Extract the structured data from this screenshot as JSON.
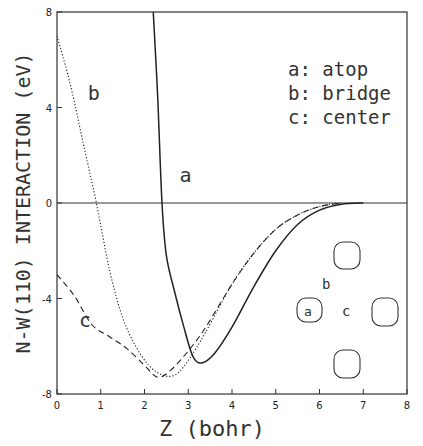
{
  "chart_data": {
    "type": "line",
    "title": "",
    "xlabel": "Z (bohr)",
    "ylabel": "N-W(110) INTERACTION (eV)",
    "xlim": [
      0,
      8
    ],
    "ylim": [
      -8,
      8
    ],
    "xticks": [
      "0",
      "1",
      "2",
      "3",
      "4",
      "5",
      "6",
      "7",
      "8"
    ],
    "yticks": [
      "-8",
      "-4",
      "0",
      "4",
      "8"
    ],
    "grid": false,
    "legend": [
      {
        "key": "a:",
        "label": "atop"
      },
      {
        "key": "b:",
        "label": "bridge"
      },
      {
        "key": "c:",
        "label": "center"
      }
    ],
    "series": [
      {
        "name": "a",
        "label": "atop",
        "style": "solid",
        "x": [
          2.2,
          2.3,
          2.4,
          2.5,
          2.7,
          2.9,
          3.1,
          3.3,
          3.6,
          4.0,
          4.5,
          5.0,
          5.5,
          6.0,
          6.5,
          7.0
        ],
        "y": [
          8.0,
          4.5,
          0.0,
          -2.2,
          -3.8,
          -5.2,
          -6.4,
          -6.7,
          -6.3,
          -5.2,
          -3.5,
          -2.0,
          -0.9,
          -0.3,
          -0.05,
          0.0
        ]
      },
      {
        "name": "b",
        "label": "bridge",
        "style": "dotted",
        "x": [
          0.0,
          0.3,
          0.6,
          0.9,
          1.2,
          1.5,
          1.8,
          2.1,
          2.4,
          2.7,
          3.0,
          3.4,
          4.0,
          4.5,
          5.0,
          5.5,
          6.0,
          6.5
        ],
        "y": [
          7.0,
          5.0,
          2.5,
          0.0,
          -2.8,
          -4.8,
          -6.0,
          -6.8,
          -7.2,
          -7.2,
          -6.6,
          -5.4,
          -3.4,
          -2.1,
          -1.1,
          -0.5,
          -0.15,
          0.0
        ]
      },
      {
        "name": "c",
        "label": "center",
        "style": "dashed",
        "x": [
          0.0,
          0.4,
          0.8,
          1.2,
          1.6,
          2.0,
          2.3,
          2.6,
          3.0,
          3.4,
          4.0,
          4.5,
          5.0,
          5.5,
          6.0,
          6.5
        ],
        "y": [
          -3.0,
          -3.9,
          -5.1,
          -5.6,
          -6.1,
          -6.8,
          -7.3,
          -7.0,
          -6.2,
          -5.2,
          -3.4,
          -2.1,
          -1.1,
          -0.5,
          -0.15,
          0.0
        ]
      }
    ],
    "annotations": [
      {
        "text": "a",
        "x": 2.8,
        "y": 0.9
      },
      {
        "text": "b",
        "x": 0.7,
        "y": 4.3
      },
      {
        "text": "c",
        "x": 0.5,
        "y": -5.2
      }
    ],
    "inset": {
      "description": "W(110) surface unit sketch with adsorption sites",
      "labels": [
        "a",
        "b",
        "c"
      ]
    }
  }
}
